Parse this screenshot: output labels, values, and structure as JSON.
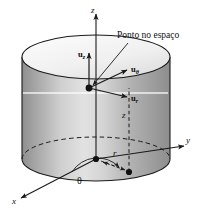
{
  "figure": {
    "background_color": "#ffffff",
    "line_color": "#1a1a1a",
    "cylinder_fill_light": "#f2f2f2",
    "cylinder_fill_mid": "#c9c9c9",
    "cylinder_fill_dark": "#9a9a9a"
  },
  "axes": {
    "z_label": "z",
    "y_label": "y",
    "x_label": "x"
  },
  "vectors": {
    "u_z": {
      "base": "u",
      "subscript": "z"
    },
    "u_theta": {
      "base": "u",
      "subscript": "θ"
    },
    "u_r": {
      "base": "u",
      "subscript": "r"
    }
  },
  "annotations": {
    "point_caption": "Ponto no espaço",
    "angle_label": "θ",
    "radius_label": "r",
    "height_label": "z"
  }
}
